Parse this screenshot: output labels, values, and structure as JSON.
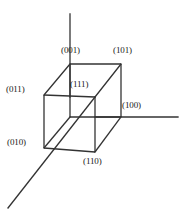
{
  "figure": {
    "name": "cube-miller-index-diagram",
    "background_color": "#ffffff",
    "line_color": "#333333",
    "text_color": "#1a1a1a",
    "width": 182,
    "height": 210
  },
  "axes": {
    "vertical": {
      "name": "z-axis",
      "x1": 70,
      "y1": 14,
      "x2": 70,
      "y2": 97
    },
    "horizontal": {
      "name": "x-axis",
      "x1": 95,
      "y1": 117,
      "x2": 178,
      "y2": 117
    },
    "diagonal": {
      "name": "y-axis",
      "x1": 95,
      "y1": 97,
      "x2": 8,
      "y2": 208
    }
  },
  "cube": {
    "front_face": {
      "top_left": {
        "x": 44,
        "y": 95
      },
      "top_right": {
        "x": 95,
        "y": 97
      },
      "bottom_right": {
        "x": 95,
        "y": 152
      },
      "bottom_left": {
        "x": 44,
        "y": 148
      }
    },
    "back_face": {
      "top_left": {
        "x": 70,
        "y": 64
      },
      "top_right": {
        "x": 121,
        "y": 64
      },
      "bottom_right": {
        "x": 121,
        "y": 117
      },
      "bottom_left": {
        "x": 70,
        "y": 117
      }
    }
  },
  "labels": {
    "top_back_left": "(001)",
    "top_back_right": "(101)",
    "mid_front_left": "(011)",
    "center_interior": "(111)",
    "mid_back_right": "(100)",
    "bottom_front_left": "(010)",
    "bottom_front_right": "(110)"
  }
}
